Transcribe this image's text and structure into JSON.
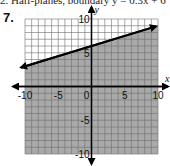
{
  "page": {
    "top_text": "2. Half-planes, boundary y = 0.3x + 6",
    "problem_number": "7."
  },
  "graph": {
    "x_axis_label": "x",
    "y_axis_label": "y",
    "x_tick_labels": [
      "-10",
      "-5",
      "0",
      "5",
      "10"
    ],
    "y_tick_labels": [
      "10",
      "5",
      "-5",
      "-10"
    ],
    "colors": {
      "shade": "#a9a9a9",
      "grid": "#6e6e6e",
      "axis": "#000000",
      "line": "#000000"
    }
  },
  "chart_data": {
    "type": "area",
    "title": "",
    "xlabel": "x",
    "ylabel": "y",
    "xlim": [
      -10,
      10
    ],
    "ylim": [
      -10,
      10
    ],
    "grid": true,
    "tick_step": 1,
    "labeled_ticks": {
      "x": [
        -10,
        -5,
        0,
        5,
        10
      ],
      "y": [
        -10,
        -5,
        5,
        10
      ]
    },
    "series": [
      {
        "name": "boundary line",
        "equation": "y = 0.3x + 6",
        "style": "solid",
        "x": [
          -10,
          10
        ],
        "y": [
          3,
          9
        ]
      }
    ],
    "shaded_region": "below boundary line (y < 0.3x + 6)",
    "legend": "none"
  }
}
